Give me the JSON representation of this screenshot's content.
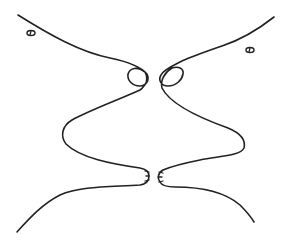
{
  "figure": {
    "description": "Line drawing of two mirrored face profiles facing each other (faces/vase illusion)",
    "stroke_color": "#222222",
    "background_color": "#ffffff",
    "stroke_width": 1.6
  },
  "left_profile": {
    "label": "left face profile",
    "path": "M18 15 C 50 35, 80 52, 110 58 C 125 61, 140 66, 147 74 C 150 80, 146 86, 140 86 C 132 86, 127 80, 128 74 C 130 68, 137 66, 145 72 C 148 78, 147 85, 140 90 C 118 100, 90 110, 72 120 C 62 126, 60 136, 66 144 C 80 158, 112 164, 140 168 C 146 169, 149 172, 149 176 C 149 181, 146 184, 140 185 C 110 187, 80 186, 60 195 C 42 204, 28 220, 17 232",
    "eye": {
      "cx": 31,
      "cy": 33,
      "rx": 4,
      "ry": 2.5
    },
    "lip_marks": [
      {
        "x1": 145,
        "y1": 171,
        "x2": 149,
        "y2": 172
      },
      {
        "x1": 146,
        "y1": 176,
        "x2": 149,
        "y2": 176
      },
      {
        "x1": 145,
        "y1": 181,
        "x2": 149,
        "y2": 180
      }
    ]
  },
  "right_profile": {
    "label": "right face profile",
    "path": "M274 17 C 255 32, 240 40, 222 46 C 205 52, 190 57, 180 62 C 172 66, 163 70, 161 75 C 158 80, 161 86, 168 86 C 176 86, 182 80, 183 74 C 184 68, 178 66, 172 68 C 165 72, 160 80, 162 88 C 170 104, 200 118, 228 128 C 240 133, 246 140, 244 148 C 240 156, 220 156, 200 160 C 185 163, 170 167, 163 170 C 158 173, 157 178, 160 182 C 162 186, 168 187, 175 187 C 200 187, 225 192, 240 205 C 246 211, 251 217, 254 222",
    "eye": {
      "cx": 250,
      "cy": 50,
      "rx": 4,
      "ry": 2.5
    },
    "lip_marks": [
      {
        "x1": 159,
        "y1": 172,
        "x2": 163,
        "y2": 173
      },
      {
        "x1": 158,
        "y1": 177,
        "x2": 162,
        "y2": 177
      },
      {
        "x1": 159,
        "y1": 182,
        "x2": 163,
        "y2": 181
      }
    ]
  }
}
